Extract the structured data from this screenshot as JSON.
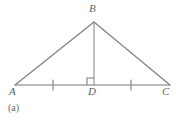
{
  "figure": {
    "caption": "(a)",
    "stroke_color": "#7b7b7b",
    "label_color": "#5f5f5f",
    "background_color": "#ffffff",
    "points": {
      "A": {
        "label": "A",
        "x": 15,
        "y": 85
      },
      "B": {
        "label": "B",
        "x": 94,
        "y": 22
      },
      "C": {
        "label": "C",
        "x": 170,
        "y": 85
      },
      "D": {
        "label": "D",
        "x": 94,
        "y": 85
      }
    },
    "segments": [
      {
        "name": "side-AB",
        "from": "A",
        "to": "B"
      },
      {
        "name": "side-BC",
        "from": "B",
        "to": "C"
      },
      {
        "name": "base-AC",
        "from": "A",
        "to": "C"
      },
      {
        "name": "altitude-BD",
        "from": "B",
        "to": "D"
      }
    ],
    "tick_marks": [
      {
        "name": "tick-AD",
        "segment": "AD",
        "x": 53,
        "count": 1
      },
      {
        "name": "tick-DC",
        "segment": "DC",
        "x": 131,
        "count": 1
      }
    ],
    "right_angle": {
      "name": "right-angle-at-D",
      "vertex": "D",
      "size": 7,
      "side": "left"
    }
  }
}
